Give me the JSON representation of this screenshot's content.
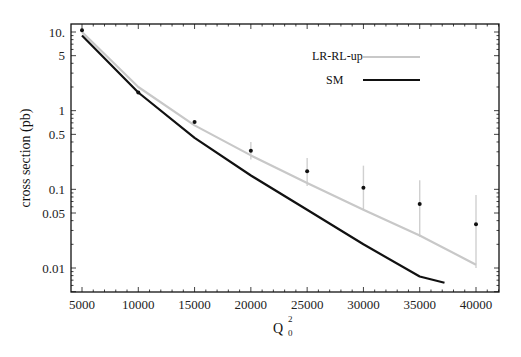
{
  "chart_data": {
    "type": "line",
    "title": "",
    "xlabel": "Q",
    "xlabel_sup": "2",
    "xlabel_sub": "0",
    "ylabel": "cross section (pb)",
    "yscale": "log",
    "xlim": [
      4300,
      42500
    ],
    "ylim": [
      0.0065,
      13
    ],
    "grid": false,
    "legend_position": "upper right",
    "x_ticks": [
      5000,
      10000,
      15000,
      20000,
      25000,
      30000,
      35000,
      40000
    ],
    "x_tick_labels": [
      "5000",
      "10000",
      "15000",
      "20000",
      "25000",
      "30000",
      "35000",
      "40000"
    ],
    "y_ticks": [
      10,
      5,
      1,
      0.5,
      0.1,
      0.05,
      0.01
    ],
    "y_tick_labels": [
      "10.",
      "5",
      "1",
      "0.5",
      "0.1",
      "0.05",
      "0.01"
    ],
    "series": [
      {
        "name": "LR-RL-up",
        "style": "line",
        "color": "#c8c8c8",
        "x": [
          5000,
          10000,
          15000,
          20000,
          25000,
          30000,
          35000,
          40000
        ],
        "values": [
          10.0,
          2.0,
          0.65,
          0.27,
          0.12,
          0.055,
          0.026,
          0.011
        ]
      },
      {
        "name": "SM",
        "style": "line",
        "color": "#111111",
        "x": [
          5000,
          10000,
          15000,
          20000,
          25000,
          30000,
          35000,
          37200
        ],
        "values": [
          9.0,
          1.7,
          0.45,
          0.15,
          0.055,
          0.02,
          0.0078,
          0.0065
        ]
      },
      {
        "name": "data",
        "style": "points_with_errorbars",
        "color": "#111111",
        "errorbar_color": "#d0d0d0",
        "x": [
          5000,
          10000,
          15000,
          20000,
          25000,
          30000,
          35000,
          40000
        ],
        "values": [
          10.5,
          1.7,
          0.72,
          0.31,
          0.17,
          0.105,
          0.065,
          0.036
        ],
        "err_low": [
          10.5,
          1.7,
          0.72,
          0.24,
          0.11,
          0.055,
          0.025,
          0.01
        ],
        "err_high": [
          10.5,
          1.7,
          0.72,
          0.4,
          0.25,
          0.2,
          0.13,
          0.085
        ]
      }
    ]
  },
  "legend": {
    "items": [
      {
        "label": "LR-RL-up",
        "color": "#c8c8c8"
      },
      {
        "label": "SM",
        "color": "#111111"
      }
    ]
  }
}
